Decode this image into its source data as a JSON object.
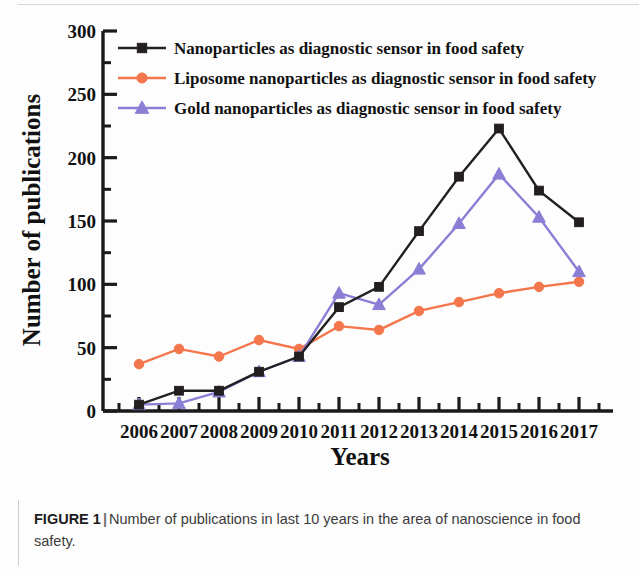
{
  "figure": {
    "caption_label": "FIGURE 1",
    "caption_separator": "|",
    "caption_body": "Number of publications in last 10 years in the area of nanoscience in food safety."
  },
  "chart_data": {
    "type": "line",
    "title": "",
    "xlabel": "Years",
    "ylabel": "Number of publications",
    "categories": [
      "2006",
      "2007",
      "2008",
      "2009",
      "2010",
      "2011",
      "2012",
      "2013",
      "2014",
      "2015",
      "2016",
      "2017"
    ],
    "xlim": [
      2005.5,
      2017.5
    ],
    "ylim": [
      0,
      300
    ],
    "yticks": [
      0,
      50,
      100,
      150,
      200,
      250,
      300
    ],
    "yticks_minor_step": 25,
    "grid": false,
    "legend_position": "top-left-inside",
    "series": [
      {
        "name": "Nanoparticles as diagnostic sensor in food safety",
        "color": "#231f20",
        "marker": "square",
        "values": [
          5,
          16,
          16,
          31,
          43,
          82,
          98,
          142,
          185,
          223,
          174,
          149
        ]
      },
      {
        "name": "Liposome nanoparticles as diagnostic sensor in food safety",
        "color": "#f4764c",
        "marker": "circle",
        "values": [
          37,
          49,
          43,
          56,
          49,
          67,
          64,
          79,
          86,
          93,
          98,
          102
        ]
      },
      {
        "name": "Gold nanoparticles as diagnostic sensor in food safety",
        "color": "#8a7fd4",
        "marker": "triangle",
        "values": [
          5,
          6,
          15,
          31,
          43,
          93,
          84,
          112,
          148,
          187,
          153,
          110
        ]
      }
    ]
  },
  "colors": {
    "series_black": "#231f20",
    "series_orange": "#f4764c",
    "series_purple": "#8a7fd4",
    "axis": "#1a1a1a",
    "caption_text": "#3b3b3b"
  }
}
